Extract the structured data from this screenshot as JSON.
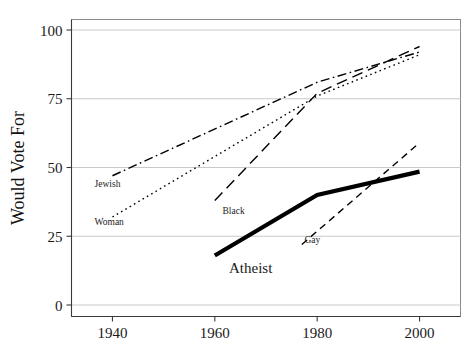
{
  "chart_data": {
    "type": "line",
    "title": "",
    "xlabel": "",
    "ylabel": "Would Vote For",
    "x": [
      1940,
      1960,
      1980,
      2000
    ],
    "xlim": [
      1932,
      2008
    ],
    "ylim": [
      0,
      100
    ],
    "xticks": [
      1940,
      1960,
      1980,
      2000
    ],
    "xticklabels": [
      "1940",
      "1960",
      "1980",
      "2000"
    ],
    "yticks": [
      0,
      25,
      50,
      75,
      100
    ],
    "yticklabels": [
      "0",
      "25",
      "50",
      "75",
      "100"
    ],
    "grid": "horizontal",
    "legend_position": "inline-labels",
    "series": [
      {
        "name": "Jewish",
        "style": "dash-dot",
        "linewidth": 1.4,
        "color": "#000000",
        "x": [
          1940,
          1980,
          2000
        ],
        "values": [
          47,
          81,
          92
        ],
        "label_x": 1936.5,
        "label_y": 43
      },
      {
        "name": "Woman",
        "style": "dotted",
        "linewidth": 1.4,
        "color": "#000000",
        "x": [
          1940,
          1980,
          2000
        ],
        "values": [
          32,
          76,
          91
        ],
        "label_x": 1936.5,
        "label_y": 29
      },
      {
        "name": "Black",
        "style": "long-dash",
        "linewidth": 1.4,
        "color": "#000000",
        "x": [
          1960,
          1980,
          2000
        ],
        "values": [
          38,
          77,
          94
        ],
        "label_x": 1961.5,
        "label_y": 33
      },
      {
        "name": "Atheist",
        "style": "solid-thick",
        "linewidth": 4.2,
        "color": "#000000",
        "x": [
          1960,
          1980,
          2000
        ],
        "values": [
          18,
          40,
          48.5
        ],
        "label_x": 1967,
        "label_y": 11.5
      },
      {
        "name": "Gay",
        "style": "dashed",
        "linewidth": 1.4,
        "color": "#000000",
        "x": [
          1977,
          2000
        ],
        "values": [
          22,
          59
        ],
        "label_x": 1977.5,
        "label_y": 22.5
      }
    ]
  },
  "axes": {
    "y_title": "Would Vote For"
  }
}
